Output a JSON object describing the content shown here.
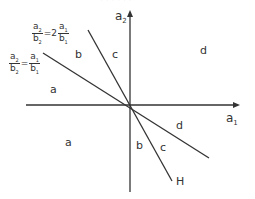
{
  "header": {
    "cut_text": "· · · · · ·"
  },
  "axes": {
    "x_label": "a",
    "x_sub": "1",
    "y_label": "a",
    "y_sub": "2"
  },
  "lines": {
    "eq1": {
      "n1": "a",
      "n1s": "2",
      "d1": "b",
      "d1s": "2",
      "eq": "=",
      "n2": "a",
      "n2s": "1",
      "d2": "b",
      "d2s": "1"
    },
    "eq2": {
      "n1": "a",
      "n1s": "2",
      "d1": "b",
      "d1s": "2",
      "eq": "=2",
      "n2": "a",
      "n2s": "1",
      "d2": "b",
      "d2s": "1"
    },
    "h_label": "H"
  },
  "regions": {
    "a_upper": "a",
    "b_upper": "b",
    "c_upper": "c",
    "d_upper": "d",
    "a_lower": "a",
    "b_lower": "b",
    "c_lower": "c",
    "d_lower": "d"
  },
  "colors": {
    "ink": "#333333",
    "background": "#ffffff"
  }
}
